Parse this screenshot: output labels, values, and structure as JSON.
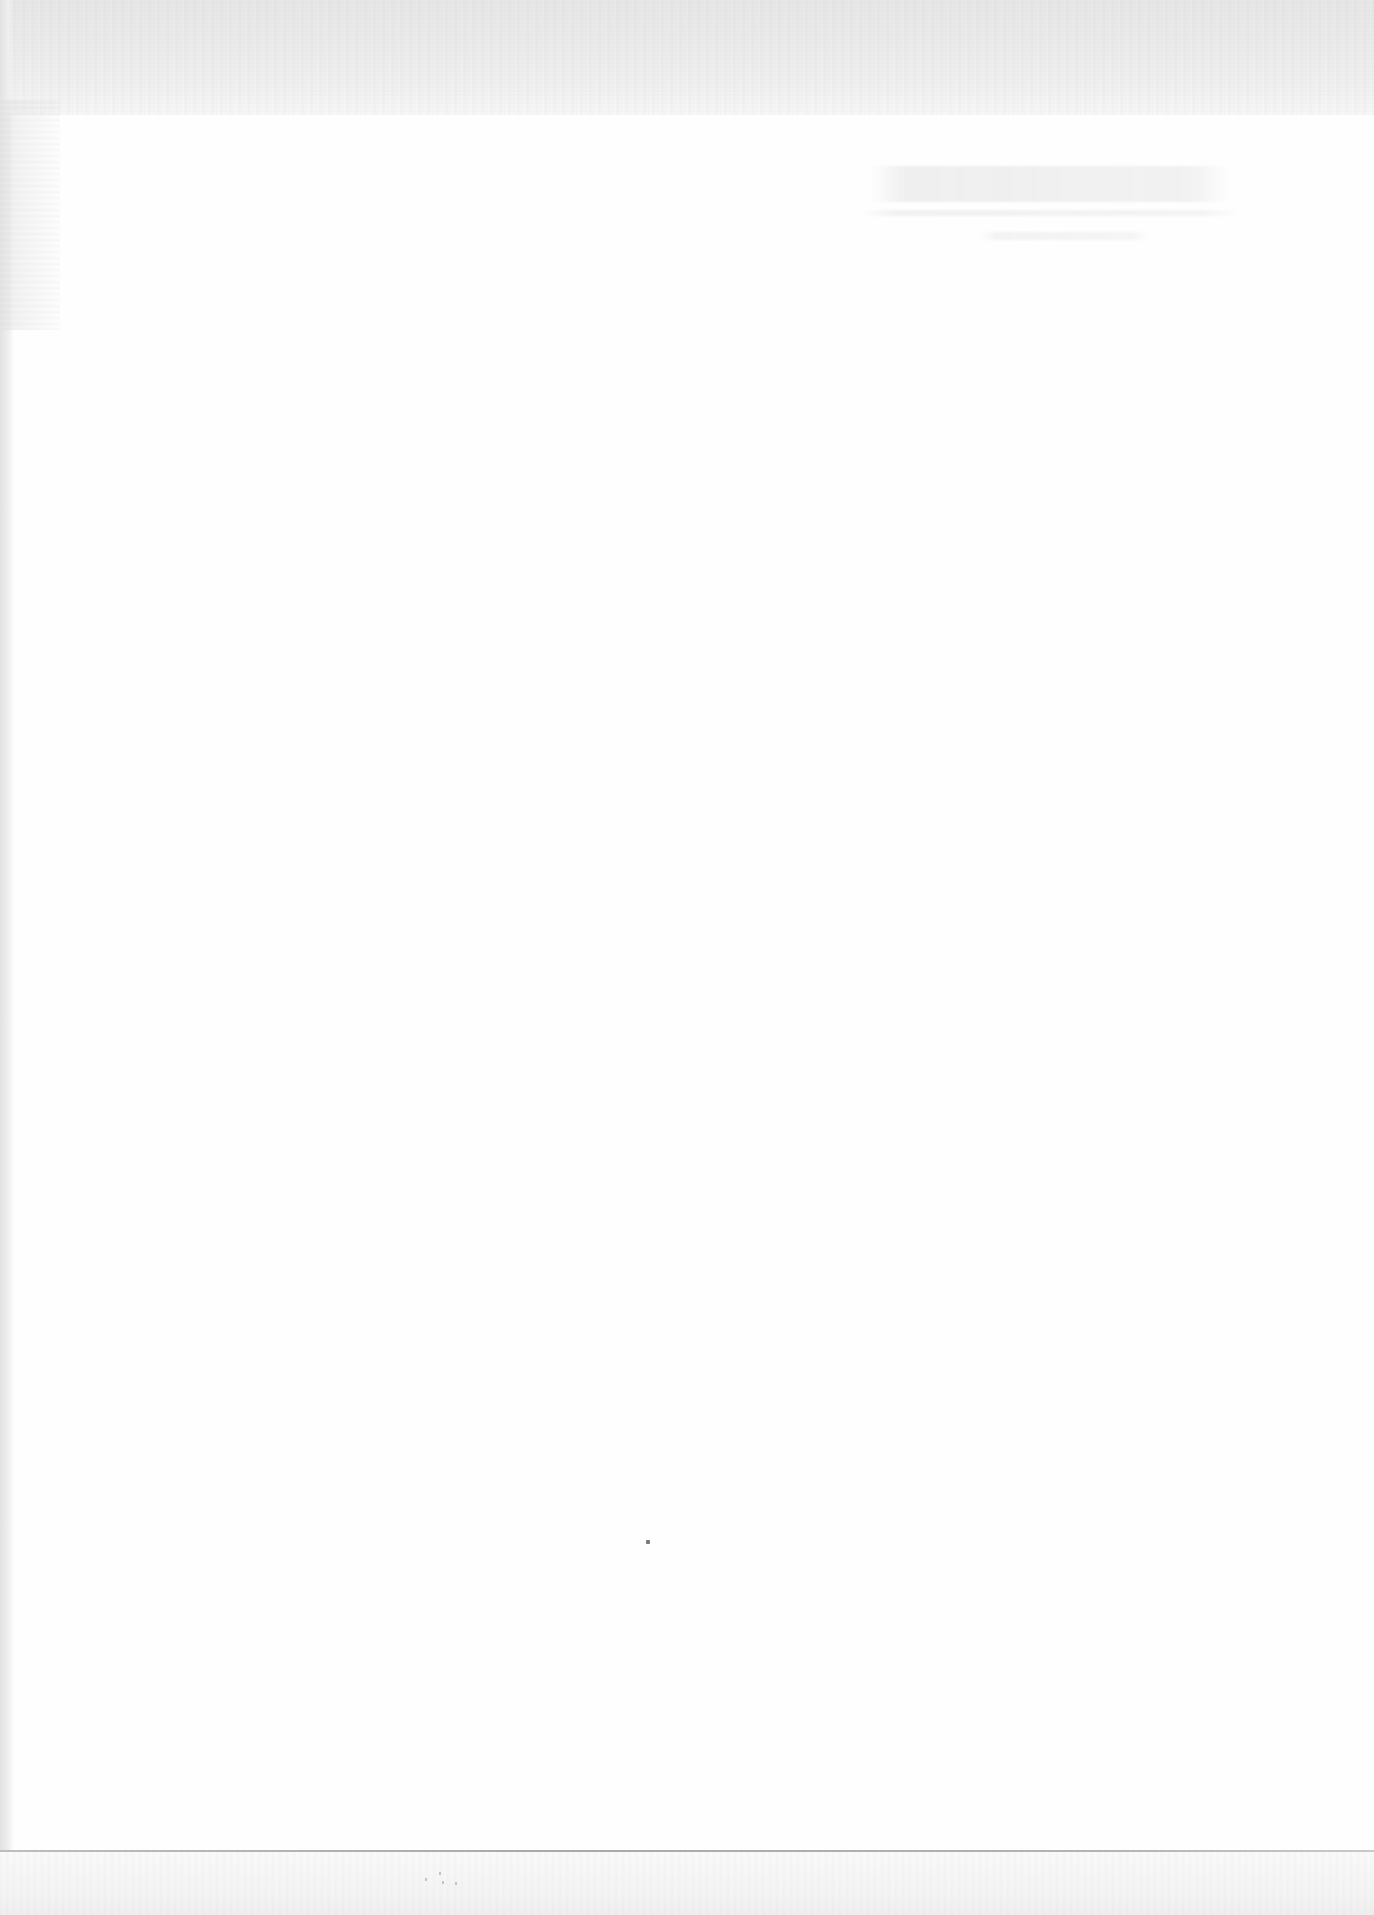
{
  "document": {
    "type": "scanned-page",
    "content_state": "blank",
    "title_block": {
      "legible": false,
      "text": ""
    },
    "colors": {
      "paper": "#fefefe",
      "scan_band": "#efefef",
      "rule": "#b0b0b0",
      "speck": "#7a7a7a"
    }
  }
}
